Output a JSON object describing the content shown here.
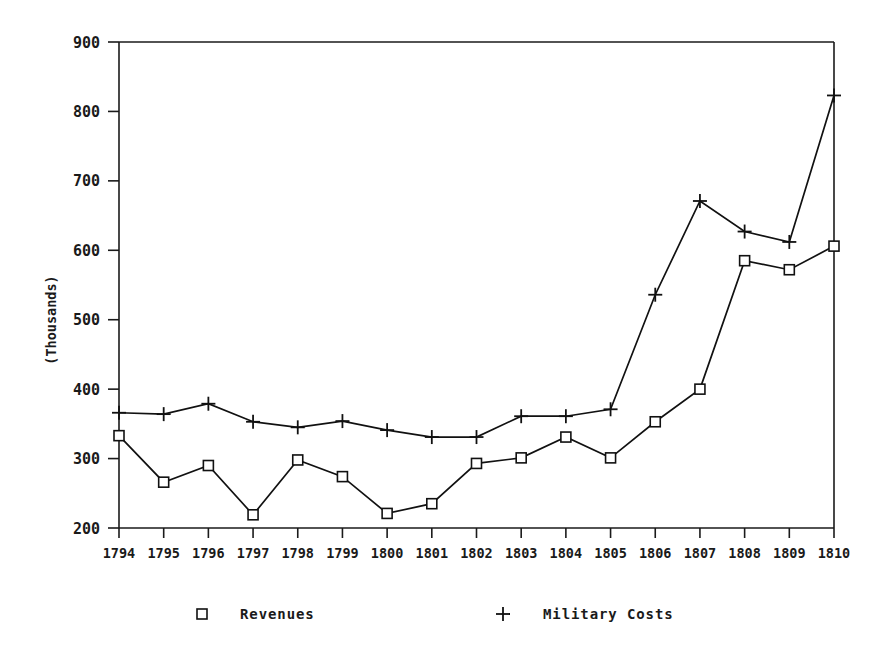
{
  "chart_data": {
    "type": "line",
    "title": "",
    "subtitle": "",
    "xlabel": "",
    "ylabel": "(Thousands)",
    "categories": [
      "1794",
      "1795",
      "1796",
      "1797",
      "1798",
      "1799",
      "1800",
      "1801",
      "1802",
      "1803",
      "1804",
      "1805",
      "1806",
      "1807",
      "1808",
      "1809",
      "1810"
    ],
    "ylim": [
      200,
      900
    ],
    "yticks": [
      200,
      300,
      400,
      500,
      600,
      700,
      800,
      900
    ],
    "grid": false,
    "legend_position": "bottom",
    "series": [
      {
        "name": "Revenues",
        "marker": "square",
        "values": [
          333,
          266,
          290,
          219,
          298,
          274,
          221,
          235,
          293,
          301,
          331,
          301,
          353,
          400,
          585,
          572,
          606
        ]
      },
      {
        "name": "Military Costs",
        "marker": "plus",
        "values": [
          366,
          364,
          379,
          353,
          345,
          354,
          341,
          331,
          331,
          361,
          361,
          371,
          536,
          671,
          627,
          612,
          823
        ]
      }
    ]
  },
  "legend": {
    "items": [
      {
        "label": "Revenues",
        "marker": "square-marker"
      },
      {
        "label": "Military Costs",
        "marker": "plus-marker"
      }
    ]
  },
  "axes": {
    "y_title": "(Thousands)",
    "y_tick_labels": [
      "900",
      "800",
      "700",
      "600",
      "500",
      "400",
      "300",
      "200"
    ],
    "x_tick_labels": [
      "1794",
      "1795",
      "1796",
      "1797",
      "1798",
      "1799",
      "1800",
      "1801",
      "1802",
      "1803",
      "1804",
      "1805",
      "1806",
      "1807",
      "1808",
      "1809",
      "1810"
    ]
  },
  "colors": {
    "line": "#111111",
    "text": "#1a1a1a",
    "background": "#ffffff"
  }
}
